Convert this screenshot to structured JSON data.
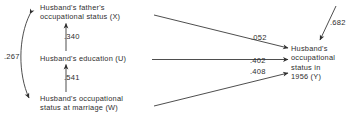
{
  "figure": {
    "type": "path-diagram",
    "nodes": [
      {
        "id": "X",
        "name": "husband-father-occupational-status",
        "lines": [
          "Husband's father's",
          "occupational status (X)"
        ],
        "line1": "Husband's father's",
        "line2": "occupational status (X)",
        "symbol": "X"
      },
      {
        "id": "U",
        "name": "husband-education",
        "lines": [
          "Husband's education (U)"
        ],
        "line1": "Husband's education (U)",
        "symbol": "U"
      },
      {
        "id": "W",
        "name": "husband-occupational-status-at-marriage",
        "lines": [
          "Husband's occupational",
          "status at marriage (W)"
        ],
        "line1": "Husband's occupational",
        "line2": "status at marriage (W)",
        "symbol": "W"
      },
      {
        "id": "Y",
        "name": "husband-occupational-status-1956",
        "lines": [
          "Husband's",
          "occupational",
          "status in",
          "1956 (Y)"
        ],
        "line1": "Husband's",
        "line2": "occupational",
        "line3": "status in",
        "line4": "1956 (Y)",
        "symbol": "Y"
      }
    ],
    "paths": [
      {
        "id": "XU",
        "from": "U",
        "to": "X",
        "label": ".340",
        "kind": "directed"
      },
      {
        "id": "UW",
        "from": "W",
        "to": "U",
        "label": ".541",
        "kind": "directed"
      },
      {
        "id": "XW",
        "from": "X",
        "to": "W",
        "label": ".267",
        "kind": "correlation"
      },
      {
        "id": "XY",
        "from": "X",
        "to": "Y",
        "label": ".052",
        "kind": "directed"
      },
      {
        "id": "UY",
        "from": "U",
        "to": "Y",
        "label": ".402",
        "kind": "directed"
      },
      {
        "id": "WY",
        "from": "W",
        "to": "Y",
        "label": ".408",
        "kind": "directed"
      },
      {
        "id": "RY",
        "from": "residual",
        "to": "Y",
        "label": ".682",
        "kind": "residual"
      }
    ],
    "colors": {
      "ink": "#2e2e2e",
      "background": "#ffffff"
    }
  }
}
